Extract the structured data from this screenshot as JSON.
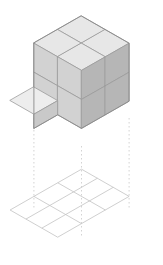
{
  "figure": {
    "canvas": {
      "width": 163,
      "height": 265,
      "background": "#ffffff"
    }
  },
  "iso": {
    "origin_x": 81.5,
    "origin_y": 103.0,
    "half_width": 23.8,
    "half_height": 13.6,
    "cube_height": 29.0,
    "projection": "isometric-dimetric"
  },
  "palette": {
    "top_face": "#e7e7e7",
    "left_face": "#d2d2d2",
    "right_face": "#b6b6b6",
    "notch_top_face": "#ededed",
    "notch_left_face": "#c9c9c9",
    "edge_stroke": "#8a8a8a",
    "inner_edge_stroke": "#9a9a9a",
    "grid_stroke": "#c3c3c3",
    "dashed_stroke": "#c8c8c8"
  },
  "structure": {
    "description": "2 x 2 x 2 block of unit cubes with the front-left-bottom cube removed",
    "grid_dimensions": {
      "x": 2,
      "y": 2,
      "z": 2
    },
    "total_cubes": 8,
    "visible_cubes": 7,
    "removed_cubes": 1,
    "removed_cube_position": {
      "x": 0,
      "y": 1,
      "z": 0
    },
    "top_faces_count": 4,
    "left_faces_count": 4,
    "right_faces_count": 4
  },
  "base_grid": {
    "label": "ground-projection-grid",
    "rows": 3,
    "cols": 3,
    "cells": 9,
    "center_x": 81.5,
    "center_y": 210.0,
    "cell_half_width": 23.8,
    "cell_half_height": 13.6
  },
  "projection_lines": {
    "label": "dashed-drop-lines",
    "count": 3,
    "style": "dashed",
    "dash_pattern": "1.5 2.5",
    "lines": [
      {
        "name": "left-drop-line",
        "x": 33.9,
        "y_top": 118.0,
        "y_bottom": 210.0
      },
      {
        "name": "center-drop-line",
        "x": 81.5,
        "y_top": 146.0,
        "y_bottom": 237.0
      },
      {
        "name": "right-drop-line",
        "x": 129.1,
        "y_top": 118.0,
        "y_bottom": 210.0
      }
    ]
  },
  "faces": {
    "top": [
      {
        "name": "top-face-back",
        "points": "81.5,16.0 105.3,29.6 81.5,43.2 57.7,29.6"
      },
      {
        "name": "top-face-left",
        "points": "57.7,29.6 81.5,43.2 57.7,56.8 33.9,43.2"
      },
      {
        "name": "top-face-right",
        "points": "105.3,29.6 129.1,43.2 105.3,56.8 81.5,43.2"
      },
      {
        "name": "top-face-front",
        "points": "81.5,43.2 105.3,56.8 81.5,70.4 57.7,56.8"
      }
    ],
    "left": [
      {
        "name": "left-face-upper-back",
        "points": "33.9,43.2 57.7,56.8 57.7,85.8 33.9,72.2"
      },
      {
        "name": "left-face-upper-front",
        "points": "57.7,56.8 81.5,70.4 81.5,99.4 57.7,85.8"
      },
      {
        "name": "left-face-lower-back",
        "points": "33.9,72.2 57.7,85.8 57.7,114.8 33.9,101.2"
      },
      {
        "name": "left-face-lower-front",
        "points": "57.7,85.8 81.5,99.4 81.5,128.4 57.7,114.8"
      }
    ],
    "right": [
      {
        "name": "right-face-upper-left",
        "points": "81.5,70.4 105.3,56.8 105.3,85.8 81.5,99.4"
      },
      {
        "name": "right-face-upper-right",
        "points": "105.3,56.8 129.1,43.2 129.1,72.2 105.3,85.8"
      },
      {
        "name": "right-face-lower-left",
        "points": "81.5,99.4 105.3,85.8 105.3,114.8 81.5,128.4"
      },
      {
        "name": "right-face-lower-right",
        "points": "105.3,85.8 129.1,72.2 129.1,101.2 105.3,114.8"
      }
    ],
    "notch": [
      {
        "name": "notch-floor-top-face",
        "points": "33.9,87.0 57.7,100.6 33.9,114.2 10.1,100.6"
      },
      {
        "name": "notch-inner-right",
        "points": "57.7,85.8 57.7,114.8 33.9,128.4 33.9,99.4"
      }
    ]
  },
  "outline": {
    "name": "structure-silhouette",
    "points": "81.5,16.0 129.1,43.2 129.1,101.2 81.5,128.4 57.7,114.8 33.9,128.4 33.9,43.2"
  }
}
